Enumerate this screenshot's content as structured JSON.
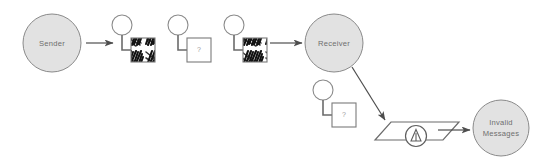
{
  "diagram": {
    "type": "flow-diagram",
    "background_color": "#ffffff",
    "palette": {
      "actor_fill": "#e2e2e2",
      "actor_stroke": "#8a8a8a",
      "label_color": "#6e6e6e",
      "line_color": "#595959",
      "box_stroke": "#7a7a7a",
      "box_fill": "#ffffff",
      "scribble_color": "#111111",
      "qmark_color": "#9a9a9a"
    },
    "nodes": {
      "sender": {
        "label": "Sender",
        "shape": "circle",
        "fill": "#e2e2e2",
        "cx": 52,
        "cy": 43,
        "r": 29
      },
      "receiver": {
        "label": "Receiver",
        "shape": "circle",
        "fill": "#e2e2e2",
        "cx": 334,
        "cy": 43,
        "r": 29
      },
      "invalid_messages": {
        "label_line1": "Invalid",
        "label_line2": "Messages",
        "shape": "circle",
        "fill": "#e2e2e2",
        "cx": 501,
        "cy": 128,
        "r": 28
      },
      "validator": {
        "shape": "parallelogram",
        "icon": "warning-triangle-icon",
        "cx": 416,
        "cy": 131
      }
    },
    "messages": [
      {
        "id": "message-1",
        "state": "scribbled",
        "marker": "",
        "circle": {
          "cx": 122,
          "cy": 25,
          "r": 10
        },
        "box": {
          "x": 131,
          "y": 38,
          "w": 24,
          "h": 24
        }
      },
      {
        "id": "message-2",
        "state": "unknown",
        "marker": "?",
        "circle": {
          "cx": 178,
          "cy": 25,
          "r": 10
        },
        "box": {
          "x": 187,
          "y": 38,
          "w": 24,
          "h": 24
        }
      },
      {
        "id": "message-3",
        "state": "scribbled",
        "marker": "",
        "circle": {
          "cx": 234,
          "cy": 25,
          "r": 10
        },
        "box": {
          "x": 243,
          "y": 38,
          "w": 24,
          "h": 24
        }
      },
      {
        "id": "message-4",
        "state": "unknown",
        "marker": "?",
        "circle": {
          "cx": 323,
          "cy": 90,
          "r": 10
        },
        "box": {
          "x": 332,
          "y": 103,
          "w": 24,
          "h": 24
        }
      }
    ],
    "connections": [
      {
        "id": "sender-to-stream",
        "from": "sender",
        "to": "message-1",
        "style": "arrow"
      },
      {
        "id": "stream-to-receiver",
        "from": "message-3",
        "to": "receiver",
        "style": "arrow"
      },
      {
        "id": "receiver-to-validator",
        "from": "receiver",
        "to": "validator",
        "style": "arrow-diagonal"
      },
      {
        "id": "validator-to-invalid",
        "from": "validator",
        "to": "invalid_messages",
        "style": "arrow"
      }
    ]
  }
}
